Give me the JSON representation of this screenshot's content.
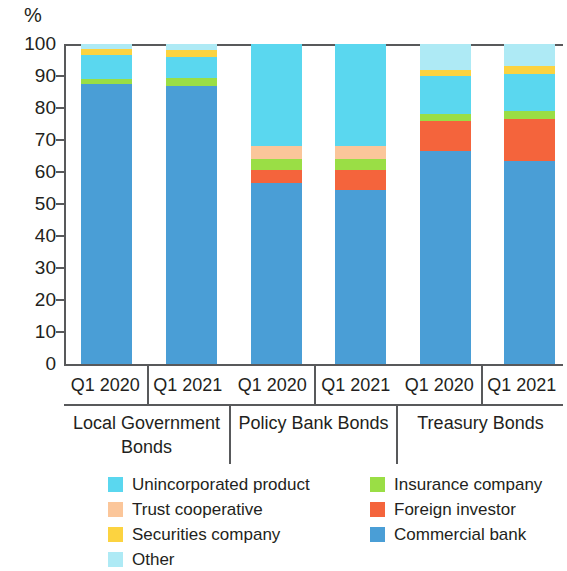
{
  "axis": {
    "unit": "%",
    "ticks": [
      "100",
      "90",
      "80",
      "70",
      "60",
      "50",
      "40",
      "30",
      "20",
      "10",
      "0"
    ]
  },
  "groups": [
    {
      "name": "Local Government Bonds",
      "periods": [
        "Q1 2020",
        "Q1 2021"
      ]
    },
    {
      "name": "Policy Bank Bonds",
      "periods": [
        "Q1 2020",
        "Q1 2021"
      ]
    },
    {
      "name": "Treasury Bonds",
      "periods": [
        "Q1 2020",
        "Q1 2021"
      ]
    }
  ],
  "legend": {
    "left": [
      {
        "label": "Unincorporated product",
        "color": "#5ad7ef"
      },
      {
        "label": "Trust cooperative",
        "color": "#fbc69a"
      },
      {
        "label": "Securities company",
        "color": "#fcd340"
      },
      {
        "label": "Other",
        "color": "#aeeaf5"
      }
    ],
    "right": [
      {
        "label": "Insurance company",
        "color": "#9ade45"
      },
      {
        "label": "Foreign investor",
        "color": "#f4643c"
      },
      {
        "label": "Commercial bank",
        "color": "#4a9ed6"
      }
    ]
  },
  "colors": {
    "unincorporated_product": "#5ad7ef",
    "trust_cooperative": "#fbc69a",
    "securities_company": "#fcd340",
    "other": "#aeeaf5",
    "insurance_company": "#9ade45",
    "foreign_investor": "#f4643c",
    "commercial_bank": "#4a9ed6",
    "axis": "#58595b",
    "background": "#ffffff"
  },
  "chart_data": {
    "type": "bar",
    "stacked": true,
    "stack_total": 100,
    "title": "",
    "xlabel": "",
    "ylabel": "%",
    "ylim": [
      0,
      100
    ],
    "yticks": [
      0,
      10,
      20,
      30,
      40,
      50,
      60,
      70,
      80,
      90,
      100
    ],
    "grid": false,
    "legend_position": "bottom",
    "categories": [
      "Local Government Bonds Q1 2020",
      "Local Government Bonds Q1 2021",
      "Policy Bank Bonds Q1 2020",
      "Policy Bank Bonds Q1 2021",
      "Treasury Bonds Q1 2020",
      "Treasury Bonds Q1 2021"
    ],
    "series": [
      {
        "name": "Commercial bank",
        "color": "#4a9ed6",
        "values": [
          87.5,
          87.0,
          56.5,
          54.5,
          66.5,
          63.5
        ]
      },
      {
        "name": "Foreign investor",
        "color": "#f4643c",
        "values": [
          0.0,
          0.0,
          4.0,
          6.0,
          9.5,
          13.0
        ]
      },
      {
        "name": "Insurance company",
        "color": "#9ade45",
        "values": [
          1.5,
          2.5,
          3.5,
          3.5,
          2.0,
          2.5
        ]
      },
      {
        "name": "Trust cooperative",
        "color": "#fbc69a",
        "values": [
          0.0,
          0.0,
          4.0,
          4.0,
          0.0,
          0.0
        ]
      },
      {
        "name": "Unincorporated product",
        "color": "#5ad7ef",
        "values": [
          7.5,
          6.5,
          32.0,
          32.0,
          12.0,
          11.5
        ]
      },
      {
        "name": "Securities company",
        "color": "#fcd340",
        "values": [
          2.0,
          2.0,
          0.0,
          0.0,
          2.0,
          2.5
        ]
      },
      {
        "name": "Other",
        "color": "#aeeaf5",
        "values": [
          1.5,
          2.0,
          0.0,
          0.0,
          8.0,
          7.0
        ]
      }
    ]
  }
}
